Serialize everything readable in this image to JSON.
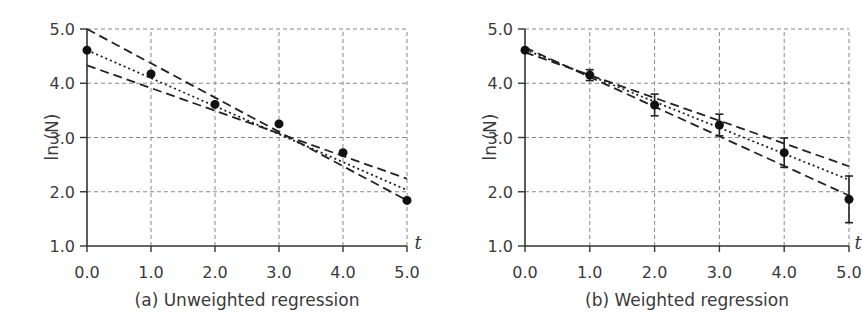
{
  "chart_data": [
    {
      "type": "scatter",
      "title": "",
      "caption": "(a) Unweighted regression",
      "xlabel": "t",
      "ylabel": "ln (N)",
      "xlim": [
        0,
        5
      ],
      "ylim": [
        1,
        5
      ],
      "xticks": [
        "0.0",
        "1.0",
        "2.0",
        "3.0",
        "4.0",
        "5.0"
      ],
      "yticks": [
        "1.0",
        "2.0",
        "3.0",
        "4.0",
        "5.0"
      ],
      "grid": true,
      "points": {
        "x": [
          0,
          1,
          2,
          3,
          4,
          5
        ],
        "y": [
          4.61,
          4.17,
          3.61,
          3.25,
          2.72,
          1.84
        ]
      },
      "lines": [
        {
          "name": "best fit",
          "style": "dotted",
          "x": [
            0,
            5
          ],
          "y": [
            4.61,
            2.03
          ]
        },
        {
          "name": "steep bound",
          "style": "dashed",
          "x": [
            0,
            5
          ],
          "y": [
            5.0,
            1.84
          ]
        },
        {
          "name": "shallow bound",
          "style": "dashed",
          "x": [
            0,
            5
          ],
          "y": [
            4.33,
            2.24
          ]
        }
      ]
    },
    {
      "type": "scatter",
      "title": "",
      "caption": "(b) Weighted regression",
      "xlabel": "t",
      "ylabel": "ln (N)",
      "xlim": [
        0,
        5
      ],
      "ylim": [
        1,
        5
      ],
      "xticks": [
        "0.0",
        "1.0",
        "2.0",
        "3.0",
        "4.0",
        "5.0"
      ],
      "yticks": [
        "1.0",
        "2.0",
        "3.0",
        "4.0",
        "5.0"
      ],
      "grid": true,
      "points": {
        "x": [
          0,
          1,
          2,
          3,
          4,
          5
        ],
        "y": [
          4.61,
          4.15,
          3.6,
          3.23,
          2.72,
          1.86
        ],
        "yerr": [
          0.03,
          0.1,
          0.2,
          0.2,
          0.27,
          0.43
        ]
      },
      "lines": [
        {
          "name": "best fit",
          "style": "dotted",
          "x": [
            0,
            5
          ],
          "y": [
            4.62,
            2.22
          ]
        },
        {
          "name": "steep bound",
          "style": "dashed",
          "x": [
            0,
            5
          ],
          "y": [
            4.66,
            1.93
          ]
        },
        {
          "name": "shallow bound",
          "style": "dashed",
          "x": [
            0,
            5
          ],
          "y": [
            4.57,
            2.47
          ]
        }
      ]
    }
  ]
}
